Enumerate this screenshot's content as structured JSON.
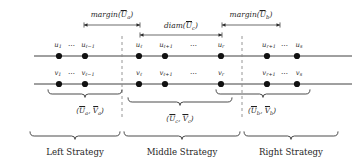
{
  "figure": {
    "colors": {
      "line": "#2b2b2b",
      "node": "#111111",
      "divider": "#8a8a8a",
      "brace": "#2b2b2b",
      "text": "#1f1f1f",
      "background": "#ffffff"
    }
  },
  "measurements": [
    {
      "id": "margin-left",
      "name": "margin-ua",
      "text": "margin(U",
      "sub": "a",
      "suffix": ")",
      "overline": true,
      "x1": 84,
      "x2": 140,
      "y": 25,
      "label_x": 112,
      "label_y": 10
    },
    {
      "id": "diam-middle",
      "name": "diam-uc",
      "text": "diam(U",
      "sub": "c",
      "suffix": ")",
      "overline": true,
      "x1": 140,
      "x2": 222,
      "y": 35,
      "label_x": 181,
      "label_y": 21
    },
    {
      "id": "margin-right",
      "name": "margin-ub",
      "text": "margin(U",
      "sub": "b",
      "suffix": ")",
      "overline": true,
      "x1": 222,
      "x2": 280,
      "y": 25,
      "label_x": 251,
      "label_y": 10
    }
  ],
  "rows": [
    {
      "id": "row-u",
      "name": "u-number-line",
      "y": 56,
      "x_start": 34,
      "x_end": 352,
      "nodes": [
        {
          "cx": 59,
          "label": "u",
          "sub": "1"
        },
        {
          "cx": 85,
          "label": "u",
          "sub": "ℓ − 1"
        },
        {
          "cx": 139,
          "label": "u",
          "sub": "ℓ"
        },
        {
          "cx": 165,
          "label": "u",
          "sub": "ℓ + 1"
        },
        {
          "cx": 221,
          "label": "u",
          "sub": "r"
        },
        {
          "cx": 267,
          "label": "u",
          "sub": "r + 1"
        },
        {
          "cx": 297,
          "label": "u",
          "sub": "s"
        }
      ],
      "groups": [
        {
          "text": "u₁ ⋯ uℓ₋₁",
          "x": 72,
          "y": 43
        },
        {
          "text": "⋯",
          "x": 193,
          "y": 45
        },
        {
          "text": "uᵣ₊₁ ⋯ uₛ",
          "x": 282,
          "y": 43
        }
      ]
    },
    {
      "id": "row-v",
      "name": "v-number-line",
      "y": 84,
      "x_start": 34,
      "x_end": 352,
      "nodes": [
        {
          "cx": 59,
          "label": "v",
          "sub": "1"
        },
        {
          "cx": 85,
          "label": "v",
          "sub": "ℓ − 1"
        },
        {
          "cx": 139,
          "label": "v",
          "sub": "ℓ"
        },
        {
          "cx": 165,
          "label": "v",
          "sub": "ℓ + 1"
        },
        {
          "cx": 221,
          "label": "v",
          "sub": "r"
        },
        {
          "cx": 267,
          "label": "v",
          "sub": "r + 1"
        },
        {
          "cx": 297,
          "label": "v",
          "sub": "s"
        }
      ],
      "groups": [
        {
          "text": "v₁ ⋯ vℓ₋₁",
          "x": 72,
          "y": 71
        },
        {
          "text": "⋯",
          "x": 193,
          "y": 73
        },
        {
          "text": "vᵣ₊₁ ⋯ vₛ",
          "x": 282,
          "y": 71
        }
      ]
    }
  ],
  "node_labels_top": [
    {
      "text": "u",
      "sub": "1",
      "x": 58,
      "y": 42
    },
    {
      "text": "⋯",
      "x": 72,
      "y": 43
    },
    {
      "text": "u",
      "sub": "ℓ−1",
      "x": 88,
      "y": 42
    },
    {
      "text": "u",
      "sub": "ℓ",
      "x": 139,
      "y": 42
    },
    {
      "text": "u",
      "sub": "ℓ+1",
      "x": 166,
      "y": 42
    },
    {
      "text": "⋯",
      "x": 194,
      "y": 43
    },
    {
      "text": "u",
      "sub": "r",
      "x": 221,
      "y": 42
    },
    {
      "text": "u",
      "sub": "r+1",
      "x": 269,
      "y": 42
    },
    {
      "text": "⋯",
      "x": 285,
      "y": 43
    },
    {
      "text": "u",
      "sub": "s",
      "x": 299,
      "y": 42
    }
  ],
  "node_labels_bottom": [
    {
      "text": "v",
      "sub": "1",
      "x": 58,
      "y": 70
    },
    {
      "text": "⋯",
      "x": 72,
      "y": 71
    },
    {
      "text": "v",
      "sub": "ℓ−1",
      "x": 88,
      "y": 70
    },
    {
      "text": "v",
      "sub": "ℓ",
      "x": 139,
      "y": 70
    },
    {
      "text": "v",
      "sub": "ℓ+1",
      "x": 166,
      "y": 70
    },
    {
      "text": "⋯",
      "x": 194,
      "y": 71
    },
    {
      "text": "v",
      "sub": "r",
      "x": 221,
      "y": 70
    },
    {
      "text": "v",
      "sub": "r+1",
      "x": 269,
      "y": 70
    },
    {
      "text": "⋯",
      "x": 285,
      "y": 71
    },
    {
      "text": "v",
      "sub": "s",
      "x": 299,
      "y": 70
    }
  ],
  "dividers": [
    {
      "id": "divider-left",
      "x": 122,
      "y1": 36,
      "y2": 118,
      "name": "divider-left-middle"
    },
    {
      "id": "divider-right",
      "x": 242,
      "y1": 36,
      "y2": 118,
      "name": "divider-middle-right"
    }
  ],
  "pair_braces": [
    {
      "id": "brace-a",
      "name": "brace-pair-a",
      "x1": 48,
      "x2": 122,
      "y": 94,
      "label_x": 90,
      "label_y": 106,
      "label": {
        "open": "(U",
        "sub1": "a",
        "mid": ", V",
        "sub2": "a",
        "close": ")"
      }
    },
    {
      "id": "brace-c",
      "name": "brace-pair-c",
      "x1": 128,
      "x2": 232,
      "y": 102,
      "label_x": 180,
      "label_y": 114,
      "label": {
        "open": "(U",
        "sub1": "c",
        "mid": ", V",
        "sub2": "c",
        "close": ")"
      }
    },
    {
      "id": "brace-b",
      "name": "brace-pair-b",
      "x1": 216,
      "x2": 310,
      "y": 94,
      "label_x": 262,
      "label_y": 106,
      "label": {
        "open": "(U",
        "sub1": "b",
        "mid": ", V",
        "sub2": "b",
        "close": ")"
      }
    }
  ],
  "strategy_braces": [
    {
      "id": "strategy-left",
      "name": "brace-strategy-left",
      "x1": 30,
      "x2": 120,
      "y": 136,
      "label": "Left Strategy",
      "label_x": 75,
      "label_y": 148
    },
    {
      "id": "strategy-middle",
      "name": "brace-strategy-middle",
      "x1": 124,
      "x2": 240,
      "y": 136,
      "label": "Middle Strategy",
      "label_x": 182,
      "label_y": 148
    },
    {
      "id": "strategy-right",
      "name": "brace-strategy-right",
      "x1": 244,
      "x2": 338,
      "y": 136,
      "label": "Right Strategy",
      "label_x": 291,
      "label_y": 148
    }
  ]
}
